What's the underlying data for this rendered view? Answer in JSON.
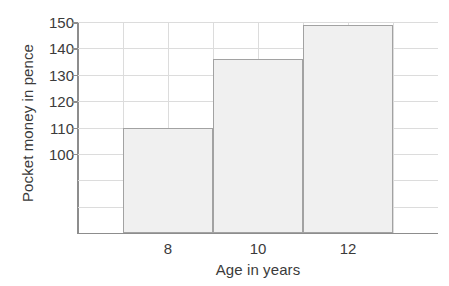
{
  "chart_data": {
    "type": "bar",
    "title": "",
    "subtitle": "",
    "xlabel": "Age in years",
    "ylabel": "Pocket money in pence",
    "categories": [
      "8",
      "10",
      "12"
    ],
    "values": [
      110,
      136,
      149
    ],
    "series": [
      {
        "name": "Pocket money",
        "values": [
          110,
          136,
          149
        ]
      }
    ],
    "ylim": [
      70,
      150
    ],
    "ytick_labels": [
      "100",
      "110",
      "120",
      "130",
      "140",
      "150"
    ],
    "ytick_values": [
      100,
      110,
      120,
      130,
      140,
      150
    ],
    "ygrid_values": [
      80,
      90,
      100,
      110,
      120,
      130,
      140,
      150
    ],
    "xtick_labels": [
      "8",
      "10",
      "12"
    ],
    "grid": true,
    "legend": false,
    "legend_position": "none",
    "annotations": [],
    "bar_fill_color": "#f0f0f0",
    "bar_border_color": "#a2a2a2",
    "gridline_color": "#dcdcdc",
    "axis_color": "#8d8d8d",
    "text_color": "#3b3b3b",
    "background_color": "#ffffff"
  }
}
